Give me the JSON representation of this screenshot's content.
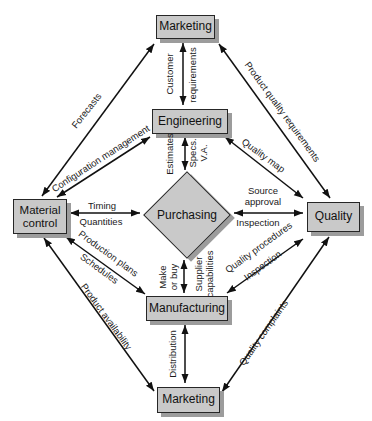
{
  "figure": {
    "background": "#ffffff",
    "node_fill": "#c9c9c9",
    "node_border": "#262626",
    "node_shadow": "#9c9c9c",
    "line_color": "#111111"
  },
  "nodes": {
    "marketing_top": "Marketing",
    "engineering": "Engineering",
    "material_control": "Material control",
    "purchasing": "Purchasing",
    "quality": "Quality",
    "manufacturing": "Manufacturing",
    "marketing_bottom": "Marketing"
  },
  "labels": {
    "forecasts": "Forecasts",
    "customer": "Customer",
    "requirements": "requirements",
    "product_quality_requirements": "Product quality requirements",
    "configuration_management": "Configuration management",
    "quality_map": "Quality map",
    "estimates": "Estimates",
    "specs_line1": "Specs.",
    "specs_line2": "V.A.",
    "timing": "Timing",
    "quantities": "Quantities",
    "source_line1": "Source",
    "source_line2": "approval",
    "inspection_right": "Inspection",
    "production_plans": "Production plans",
    "schedules": "Schedules",
    "quality_procedures": "Quality procedures",
    "inspection_lower": "Inspection",
    "make_line1": "Make",
    "make_line2": "or buy",
    "supplier_line1": "Supplier",
    "supplier_line2": "capabilities",
    "distribution": "Distribution",
    "product_availability": "Product availability",
    "quality_complaints": "Quality complaints"
  }
}
